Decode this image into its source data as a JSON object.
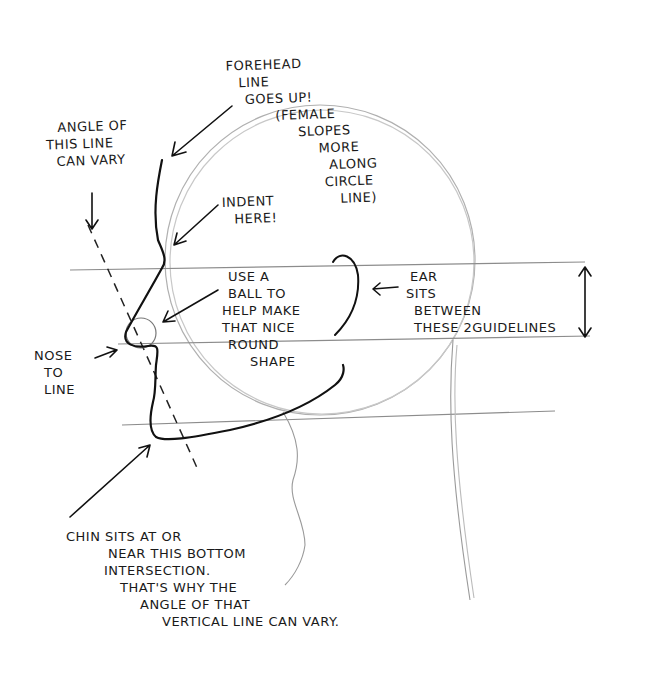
{
  "drawing": {
    "subject": "Side profile head construction sketch",
    "colors": {
      "paper": "#ffffff",
      "ink": "#111111",
      "pencil": "#a8a8a8",
      "guide": "#8c8c8c"
    }
  },
  "annotations": {
    "forehead": {
      "lines": [
        "FOREHEAD",
        "LINE",
        "GOES UP!",
        "(FEMALE",
        "SLOPES",
        "MORE",
        "ALONG",
        "CIRCLE",
        "LINE)"
      ]
    },
    "angle": {
      "lines": [
        "ANGLE OF",
        "THIS LINE",
        "CAN VARY"
      ]
    },
    "indent": {
      "lines": [
        "INDENT",
        "HERE!"
      ]
    },
    "ball": {
      "lines": [
        "USE A",
        "BALL TO",
        "HELP MAKE",
        "THAT NICE",
        "ROUND",
        "SHAPE"
      ]
    },
    "ear": {
      "lines": [
        "EAR",
        "SITS",
        "BETWEEN",
        "THESE 2GUIDELINES"
      ]
    },
    "nose": {
      "lines": [
        "NOSE",
        "TO",
        "LINE"
      ]
    },
    "chin": {
      "lines": [
        "CHIN SITS AT OR",
        "NEAR THIS BOTTOM",
        "INTERSECTION.",
        "THAT'S WHY THE",
        "ANGLE OF THAT",
        "VERTICAL LINE CAN VARY."
      ]
    }
  }
}
